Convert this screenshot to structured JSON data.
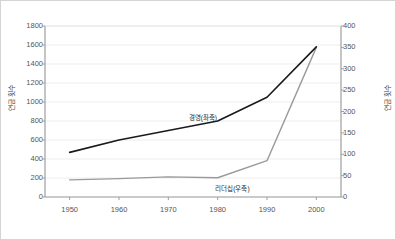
{
  "chart_data": {
    "type": "line",
    "title": "",
    "subtitle": "",
    "xlabel": "",
    "ylabel": "연금 횟수",
    "ylabel_right": "연금 횟수",
    "x": [
      1950,
      1960,
      1970,
      1980,
      1990,
      2000
    ],
    "xticklabels": [
      "1950",
      "1960",
      "1970",
      "1980",
      "1990",
      "2000"
    ],
    "xlim": [
      1945,
      2005
    ],
    "ylim": [
      0,
      1800
    ],
    "yticks": [
      0,
      200,
      400,
      600,
      800,
      1000,
      1200,
      1400,
      1600,
      1800
    ],
    "yticklabels": [
      "0",
      "200",
      "400",
      "600",
      "800",
      "1000",
      "1200",
      "1400",
      "1600",
      "1800"
    ],
    "ylim_right": [
      0,
      400
    ],
    "yticks_right": [
      0,
      50,
      100,
      150,
      200,
      250,
      300,
      350,
      400
    ],
    "yticklabels_right": [
      "0",
      "50",
      "100",
      "150",
      "200",
      "250",
      "300",
      "350",
      "400"
    ],
    "grid": "horizontal",
    "legend_position": "inline-annotations",
    "series": [
      {
        "name": "경영(좌축)",
        "axis": "left",
        "color": "#1a1a1a",
        "width": 1.6,
        "values": [
          470,
          600,
          700,
          800,
          1050,
          1580
        ],
        "annotation": {
          "text": "경영(좌축)",
          "x": 1977,
          "y": 840
        }
      },
      {
        "name": "리더십(우축)",
        "axis": "right",
        "color": "#9a9a9a",
        "width": 1.4,
        "values": [
          40,
          43,
          47,
          45,
          85,
          350
        ],
        "annotation": {
          "text": "리더십(우축)",
          "x": 1983,
          "y": 22
        }
      }
    ]
  },
  "style": {
    "figure_border_color": "#d4d4d4",
    "plot_background": "#ffffff",
    "grid_color": "#e9e9e9",
    "axis_color": "#9e9e9e",
    "tick_text_color": "#555555",
    "title_text_color": "#3a3a3a"
  }
}
